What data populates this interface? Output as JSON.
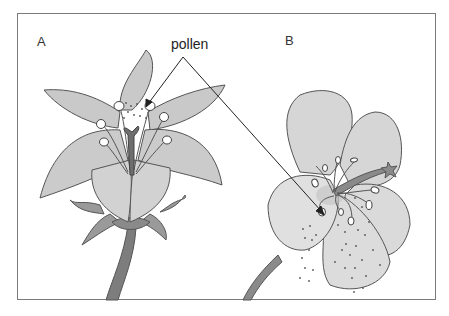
{
  "diagram": {
    "labels": {
      "flower_a": "A",
      "flower_b": "B",
      "pollen": "pollen"
    },
    "colors": {
      "petal": "#c9c9c9",
      "petal_light": "#dcdcdc",
      "outline": "#555555",
      "stem": "#7d7d7d",
      "sepal": "#9a9a9a",
      "arrow": "#222222",
      "frame": "#7a7a7a"
    }
  }
}
